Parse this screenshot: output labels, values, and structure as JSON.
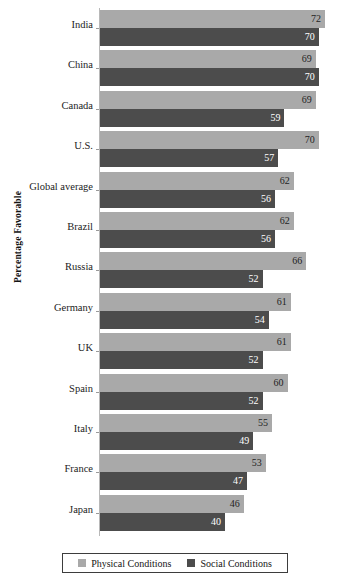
{
  "chart_data": {
    "type": "bar",
    "orientation": "horizontal",
    "title": "",
    "xlabel": "",
    "ylabel": "Percentage Favorable",
    "xlim": [
      0,
      72
    ],
    "grid": false,
    "legend_position": "bottom",
    "categories": [
      "India",
      "China",
      "Canada",
      "U.S.",
      "Global average",
      "Brazil",
      "Russia",
      "Germany",
      "UK",
      "Spain",
      "Italy",
      "France",
      "Japan"
    ],
    "series": [
      {
        "name": "Physical Conditions",
        "color": "#a9a9a9",
        "values": [
          72,
          69,
          69,
          70,
          62,
          62,
          66,
          61,
          61,
          60,
          55,
          53,
          46
        ]
      },
      {
        "name": "Social Conditions",
        "color": "#4c4c4c",
        "values": [
          70,
          70,
          59,
          57,
          56,
          56,
          52,
          54,
          52,
          52,
          49,
          47,
          40
        ]
      }
    ]
  },
  "legend": {
    "items": [
      {
        "label": "Physical Conditions",
        "swatch": "physical"
      },
      {
        "label": "Social Conditions",
        "swatch": "social"
      }
    ]
  }
}
